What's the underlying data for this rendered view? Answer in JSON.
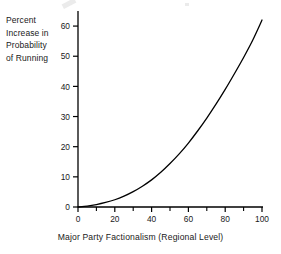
{
  "chart_data": {
    "type": "line",
    "title": "",
    "subtitle": "",
    "xlabel": "Major Party Factionalism (Regional Level)",
    "ylabel": "Percent Increase in Probability of Running",
    "ylabel_lines": [
      "Percent",
      "Increase in",
      "Probability",
      "of Running"
    ],
    "xlim": [
      0,
      100
    ],
    "ylim": [
      0,
      65
    ],
    "xticks": [
      0,
      20,
      40,
      60,
      80,
      100
    ],
    "xtick_labels": [
      "0",
      "20",
      "40",
      "60",
      "80",
      "100"
    ],
    "xminorticks": [
      10,
      30,
      50,
      70,
      90
    ],
    "yticks": [
      0,
      10,
      20,
      30,
      40,
      50,
      60
    ],
    "ytick_labels": [
      "0",
      "10",
      "20",
      "30",
      "40",
      "50",
      "60"
    ],
    "grid": false,
    "legend": false,
    "legend_position": "none",
    "line_color": "#000000",
    "line_width": 1.3,
    "background_color": "#ffffff",
    "axis_color": "#000000",
    "series": [
      {
        "name": "Percent Increase in Probability of Running",
        "x": [
          0,
          5,
          10,
          15,
          20,
          25,
          30,
          35,
          40,
          45,
          50,
          55,
          60,
          65,
          70,
          75,
          80,
          85,
          90,
          95,
          100
        ],
        "values": [
          0.0,
          0.3,
          0.8,
          1.5,
          2.4,
          3.6,
          5.1,
          6.9,
          9.0,
          11.5,
          14.4,
          17.6,
          21.2,
          25.2,
          29.5,
          34.1,
          39.0,
          44.2,
          49.6,
          55.4,
          62.0
        ]
      }
    ]
  },
  "figure": {
    "plot_area": {
      "x_origin_px": 78,
      "y_origin_px": 207,
      "x_end_px": 262,
      "y_top_px": 11
    }
  }
}
